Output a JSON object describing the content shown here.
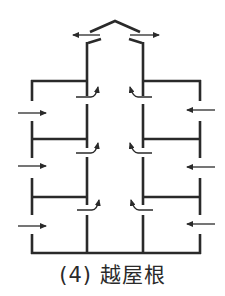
{
  "caption": "(4) 越屋根",
  "colors": {
    "line": "#2a2a2a",
    "background": "#ffffff"
  },
  "diagram": {
    "type": "building-section-ventilation",
    "floors": 3,
    "inflow_arrows": {
      "left": 3,
      "right": 3
    },
    "shaft_arrows": {
      "left": 3,
      "right": 3
    },
    "roof_outflow_arrows": 2
  }
}
